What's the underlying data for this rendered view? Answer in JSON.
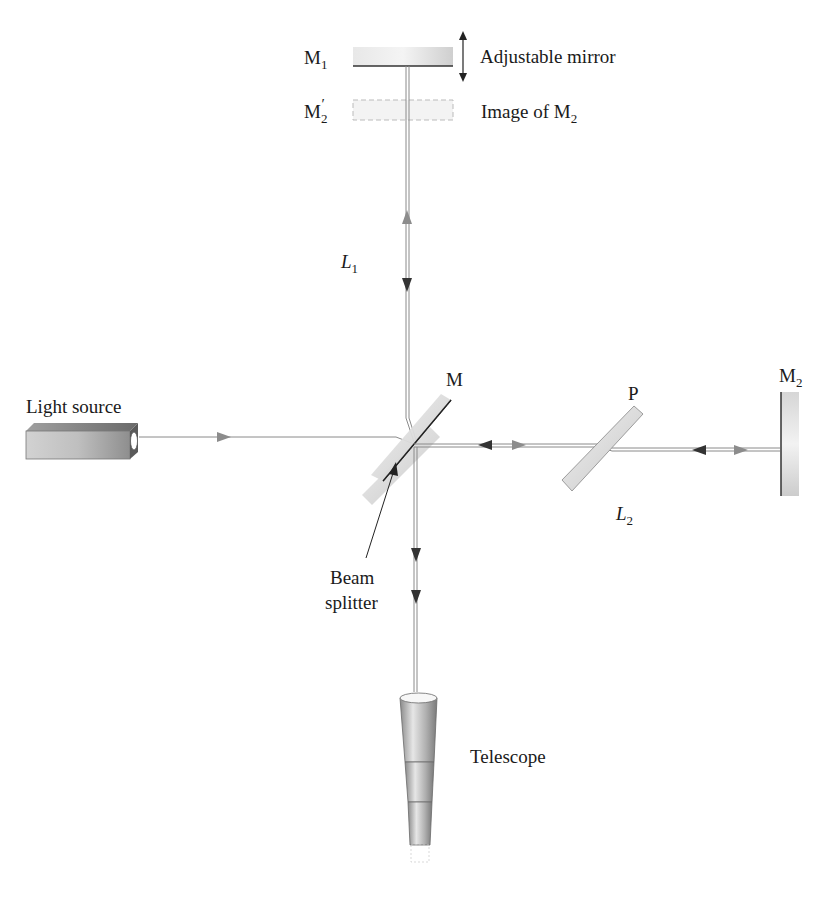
{
  "diagram": {
    "labels": {
      "m1": "M",
      "m1_sub": "1",
      "adjustable_mirror": "Adjustable mirror",
      "m2_prime": "M",
      "m2_prime_sub": "2",
      "m2_prime_mark": "′",
      "image_of_m2": "Image of M",
      "image_of_m2_sub": "2",
      "l1": "L",
      "l1_sub": "1",
      "m": "M",
      "light_source": "Light source",
      "p": "P",
      "m2": "M",
      "m2_sub": "2",
      "l2": "L",
      "l2_sub": "2",
      "beam_splitter_line1": "Beam",
      "beam_splitter_line2": "splitter",
      "telescope": "Telescope"
    },
    "components": [
      {
        "name": "adjustable-mirror-M1",
        "type": "mirror"
      },
      {
        "name": "image-of-M2",
        "type": "virtual-mirror"
      },
      {
        "name": "beam-splitter-M",
        "type": "beam-splitter"
      },
      {
        "name": "compensator-plate-P",
        "type": "glass-plate"
      },
      {
        "name": "fixed-mirror-M2",
        "type": "mirror"
      },
      {
        "name": "light-source",
        "type": "source"
      },
      {
        "name": "telescope",
        "type": "detector"
      }
    ],
    "arms": [
      {
        "name": "L1",
        "direction": "vertical"
      },
      {
        "name": "L2",
        "direction": "horizontal"
      }
    ],
    "colors": {
      "beam": "#8a8a8a",
      "arrow_dark": "#333333",
      "arrow_light": "#8c8c8c",
      "mirror_fill": "#d8d8d8",
      "text": "#1a1a1a"
    }
  }
}
